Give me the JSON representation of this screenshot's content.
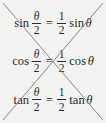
{
  "figure": {
    "background_color": "#f2f2f0",
    "text_color": "#2b2b2b",
    "strike_color": "#8a8a8a"
  },
  "equations": [
    {
      "id": "sine-identity",
      "function_left": "sin",
      "left_numerator": "θ",
      "left_denominator": "2",
      "equals": "=",
      "right_numerator": "1",
      "right_denominator": "2",
      "function_right": "sin",
      "argument_right": "θ",
      "plain": "sin θ/2 = 1/2 sin θ",
      "status": "incorrect"
    },
    {
      "id": "cosine-identity",
      "function_left": "cos",
      "left_numerator": "θ",
      "left_denominator": "2",
      "equals": "=",
      "right_numerator": "1",
      "right_denominator": "2",
      "function_right": "cos",
      "argument_right": "θ",
      "plain": "cos θ/2 = 1/2 cos θ",
      "status": "incorrect"
    },
    {
      "id": "tangent-identity",
      "function_left": "tan",
      "left_numerator": "θ",
      "left_denominator": "2",
      "equals": "=",
      "right_numerator": "1",
      "right_denominator": "2",
      "function_right": "tan",
      "argument_right": "θ",
      "plain": "tan θ/2 = 1/2 tan θ",
      "status": "incorrect"
    }
  ],
  "strikethrough": {
    "shape": "X",
    "line_count": 2,
    "stroke_width": "1",
    "color": "#8a8a8a"
  }
}
